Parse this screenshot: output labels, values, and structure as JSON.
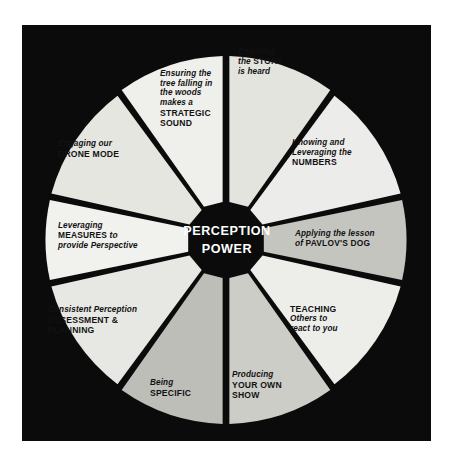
{
  "diagram": {
    "title_center": {
      "line1": "PERCEPTION",
      "line2": "POWER"
    },
    "colors": {
      "background": "#ffffff",
      "panel": "#0b0b0b",
      "segment_light": "#e9e9e4",
      "segment_gray": "#b9b9b4",
      "segment_mid": "#cfcfc9",
      "text_dark": "#121212",
      "text_light": "#ffffff"
    },
    "segments": [
      {
        "id": "story",
        "name": "ensuring-the-story-is-heard",
        "lines": [
          {
            "text": "Ensuring",
            "style": "italic"
          },
          {
            "text": "the STORY",
            "style": "mixed",
            "bold_part": "STORY"
          },
          {
            "text": "is heard",
            "style": "italic"
          }
        ],
        "fill": "#e4e4de"
      },
      {
        "id": "numbers",
        "name": "knowing-and-leveraging-the-numbers",
        "lines": [
          {
            "text": "Knowing and",
            "style": "italic"
          },
          {
            "text": "Leveraging the",
            "style": "italic"
          },
          {
            "text": "NUMBERS",
            "style": "bold"
          }
        ],
        "fill": "#ececeb"
      },
      {
        "id": "pavlovs-dog",
        "name": "applying-the-lesson-of-pavlovs-dog",
        "lines": [
          {
            "text": "Applying the lesson",
            "style": "italic"
          },
          {
            "text": "of PAVLOV'S DOG",
            "style": "mixed",
            "bold_part": "PAVLOV'S DOG"
          }
        ],
        "fill": "#c5c5c0"
      },
      {
        "id": "teaching",
        "name": "teaching-others-to-react-to-you",
        "lines": [
          {
            "text": "TEACHING",
            "style": "bold"
          },
          {
            "text": "Others to",
            "style": "italic"
          },
          {
            "text": "react to you",
            "style": "italic"
          }
        ],
        "fill": "#ededea"
      },
      {
        "id": "your-own-show",
        "name": "producing-your-own-show",
        "lines": [
          {
            "text": "Producing",
            "style": "italic"
          },
          {
            "text": "YOUR OWN",
            "style": "bold"
          },
          {
            "text": "SHOW",
            "style": "bold"
          }
        ],
        "fill": "#cdcdc8"
      },
      {
        "id": "specific",
        "name": "being-specific",
        "lines": [
          {
            "text": "Being",
            "style": "italic"
          },
          {
            "text": "SPECIFIC",
            "style": "bold"
          }
        ],
        "fill": "#bebeb9"
      },
      {
        "id": "assessment-planning",
        "name": "consistent-perception-assessment-and-planning",
        "lines": [
          {
            "text": "Consistent Perception",
            "style": "italic"
          },
          {
            "text": "ASSESSMENT &",
            "style": "bold"
          },
          {
            "text": "PLANNING",
            "style": "bold"
          }
        ],
        "fill": "#e7e7e3"
      },
      {
        "id": "measures",
        "name": "leveraging-measures-to-provide-perspective",
        "lines": [
          {
            "text": "Leveraging",
            "style": "italic"
          },
          {
            "text": "MEASURES to",
            "style": "mixed",
            "bold_part": "MEASURES"
          },
          {
            "text": "provide Perspective",
            "style": "italic"
          }
        ],
        "fill": "#f1f1ee"
      },
      {
        "id": "drone-mode",
        "name": "engaging-our-drone-mode",
        "lines": [
          {
            "text": "Engaging our",
            "style": "italic"
          },
          {
            "text": "DRONE MODE",
            "style": "bold"
          }
        ],
        "fill": "#e6e6e1"
      },
      {
        "id": "strategic-sound",
        "name": "ensuring-the-tree-falling-in-the-woods-makes-a-strategic-sound",
        "lines": [
          {
            "text": "Ensuring the",
            "style": "italic"
          },
          {
            "text": "tree falling in",
            "style": "italic"
          },
          {
            "text": "the woods",
            "style": "italic"
          },
          {
            "text": "makes a",
            "style": "italic"
          },
          {
            "text": "STRATEGIC",
            "style": "bold"
          },
          {
            "text": "SOUND",
            "style": "bold"
          }
        ],
        "fill": "#efefec"
      }
    ],
    "labels": {
      "s1_l1": "Ensuring",
      "s1_l2a": "the ",
      "s1_l2b": "STORY",
      "s1_l3": "is heard",
      "s2_l1": "Knowing and",
      "s2_l2": "Leveraging the",
      "s2_l3": "NUMBERS",
      "s3_l1": "Applying the lesson",
      "s3_l2a": "of ",
      "s3_l2b": "PAVLOV'S DOG",
      "s4_l1": "TEACHING",
      "s4_l2": "Others to",
      "s4_l3": "react to you",
      "s5_l1": "Producing",
      "s5_l2": "YOUR OWN",
      "s5_l3": "SHOW",
      "s6_l1": "Being",
      "s6_l2": "SPECIFIC",
      "s7_l1": "Consistent Perception",
      "s7_l2": "ASSESSMENT &",
      "s7_l3": "PLANNING",
      "s8_l1": "Leveraging",
      "s8_l2a": "MEASURES",
      "s8_l2b": " to",
      "s8_l3": "provide Perspective",
      "s9_l1": "Engaging our",
      "s9_l2": "DRONE MODE",
      "s10_l1": "Ensuring the",
      "s10_l2": "tree falling in",
      "s10_l3": "the woods",
      "s10_l4": "makes a",
      "s10_l5": "STRATEGIC",
      "s10_l6": "SOUND"
    }
  }
}
